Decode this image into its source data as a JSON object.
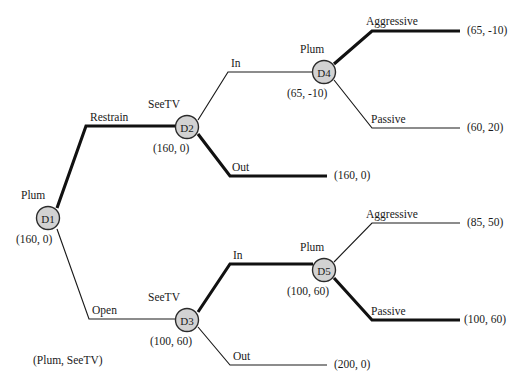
{
  "diagram": {
    "type": "extensive-form-game-tree",
    "title": "",
    "equilibrium_note": "(Plum, SeeTV)",
    "colors": {
      "node_fill": "#d2d2d2",
      "node_stroke": "#2b2b2b",
      "edge": "#1a1a1a",
      "highlight_edge": "#111111",
      "background": "#ffffff"
    }
  },
  "nodes": [
    {
      "id": "D1",
      "label": "D1",
      "player": "Plum",
      "payoff": "(160, 0)"
    },
    {
      "id": "D2",
      "label": "D2",
      "player": "SeeTV",
      "payoff": "(160, 0)"
    },
    {
      "id": "D3",
      "label": "D3",
      "player": "SeeTV",
      "payoff": "(100, 60)"
    },
    {
      "id": "D4",
      "label": "D4",
      "player": "Plum",
      "payoff": "(65, -10)"
    },
    {
      "id": "D5",
      "label": "D5",
      "player": "Plum",
      "payoff": "(100, 60)"
    }
  ],
  "edges": [
    {
      "id": "d1-restrain",
      "from": "D1",
      "to": "D2",
      "label": "Restrain",
      "highlighted": true
    },
    {
      "id": "d1-open",
      "from": "D1",
      "to": "D3",
      "label": "Open",
      "highlighted": false
    },
    {
      "id": "d2-in",
      "from": "D2",
      "to": "D4",
      "label": "In",
      "highlighted": false
    },
    {
      "id": "d2-out",
      "from": "D2",
      "to": "T-160-0",
      "label": "Out",
      "highlighted": true
    },
    {
      "id": "d4-aggressive",
      "from": "D4",
      "to": "T-65-10",
      "label": "Aggressive",
      "highlighted": true
    },
    {
      "id": "d4-passive",
      "from": "D4",
      "to": "T-60-20",
      "label": "Passive",
      "highlighted": false
    },
    {
      "id": "d3-in",
      "from": "D3",
      "to": "D5",
      "label": "In",
      "highlighted": true
    },
    {
      "id": "d3-out",
      "from": "D3",
      "to": "T-200-0",
      "label": "Out",
      "highlighted": false
    },
    {
      "id": "d5-aggressive",
      "from": "D5",
      "to": "T-85-50",
      "label": "Aggressive",
      "highlighted": false
    },
    {
      "id": "d5-passive",
      "from": "D5",
      "to": "T-100-60",
      "label": "Passive",
      "highlighted": true
    }
  ],
  "terminals": [
    {
      "id": "T-65-10",
      "payoff": "(65, -10)"
    },
    {
      "id": "T-60-20",
      "payoff": "(60, 20)"
    },
    {
      "id": "T-160-0",
      "payoff": "(160, 0)"
    },
    {
      "id": "T-85-50",
      "payoff": "(85, 50)"
    },
    {
      "id": "T-100-60",
      "payoff": "(100, 60)"
    },
    {
      "id": "T-200-0",
      "payoff": "(200, 0)"
    }
  ]
}
